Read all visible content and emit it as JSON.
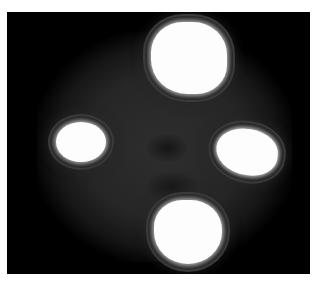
{
  "image": {
    "description": "Grayscale intensity image with four bright white spots arranged in a cross pattern on a dark background",
    "background_color": "#000000",
    "halo_color": "#2a2a2a",
    "spot_color": "#fdfdfd",
    "spots": [
      {
        "name": "top",
        "cx": 189,
        "cy": 58
      },
      {
        "name": "left",
        "cx": 80,
        "cy": 142
      },
      {
        "name": "right",
        "cx": 247,
        "cy": 152
      },
      {
        "name": "bottom",
        "cx": 188,
        "cy": 232
      }
    ]
  }
}
